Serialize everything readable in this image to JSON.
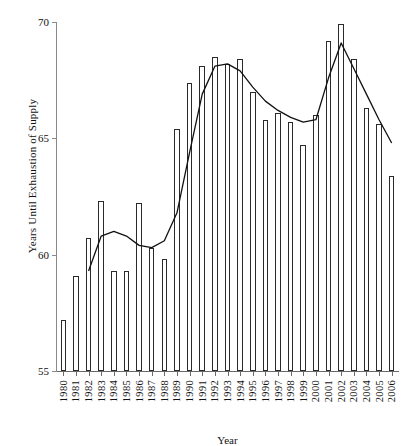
{
  "chart_data": {
    "type": "bar",
    "title": "",
    "xlabel": "Year",
    "ylabel": "Years Until Exhaustion of Supply",
    "ylim": [
      55,
      70
    ],
    "yticks": [
      55,
      60,
      65,
      70
    ],
    "grid": false,
    "legend": null,
    "categories": [
      "1980",
      "1981",
      "1982",
      "1983",
      "1984",
      "1985",
      "1986",
      "1987",
      "1988",
      "1989",
      "1990",
      "1991",
      "1992",
      "1993",
      "1994",
      "1995",
      "1996",
      "1997",
      "1998",
      "1999",
      "2000",
      "2001",
      "2002",
      "2003",
      "2004",
      "2005",
      "2006"
    ],
    "series": [
      {
        "name": "Years Until Exhaustion of Supply",
        "type": "bar",
        "values": [
          57.2,
          59.1,
          60.7,
          62.3,
          59.3,
          59.3,
          62.2,
          60.3,
          59.8,
          65.4,
          67.4,
          68.1,
          68.5,
          68.2,
          68.4,
          67.0,
          65.8,
          66.1,
          65.7,
          64.7,
          66.0,
          69.2,
          69.9,
          68.4,
          66.3,
          65.6,
          63.4
        ]
      },
      {
        "name": "Trend",
        "type": "line",
        "x": [
          "1982",
          "1983",
          "1984",
          "1985",
          "1986",
          "1987",
          "1988",
          "1989",
          "1990",
          "1991",
          "1992",
          "1993",
          "1994",
          "1995",
          "1996",
          "1997",
          "1998",
          "1999",
          "2000",
          "2001",
          "2002",
          "2003",
          "2004",
          "2005",
          "2006"
        ],
        "values": [
          59.3,
          60.8,
          61.0,
          60.8,
          60.4,
          60.3,
          60.6,
          61.8,
          64.4,
          66.9,
          68.1,
          68.2,
          67.9,
          67.2,
          66.6,
          66.2,
          65.9,
          65.7,
          65.8,
          67.6,
          69.1,
          68.0,
          66.9,
          65.8,
          64.8
        ]
      }
    ]
  }
}
